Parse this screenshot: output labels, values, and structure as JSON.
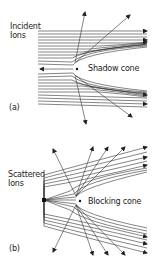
{
  "panel_a": {
    "label_line1": "Incident",
    "label_line2": "Ions",
    "cone_label": "Shadow cone",
    "panel_id": "(a)"
  },
  "panel_b": {
    "label_line1": "Scattered",
    "label_line2": "Ions",
    "cone_label": "Blocking cone",
    "panel_id": "(b)"
  },
  "colors": {
    "line": "#333333",
    "text": "#222222",
    "background": "#ffffff"
  }
}
